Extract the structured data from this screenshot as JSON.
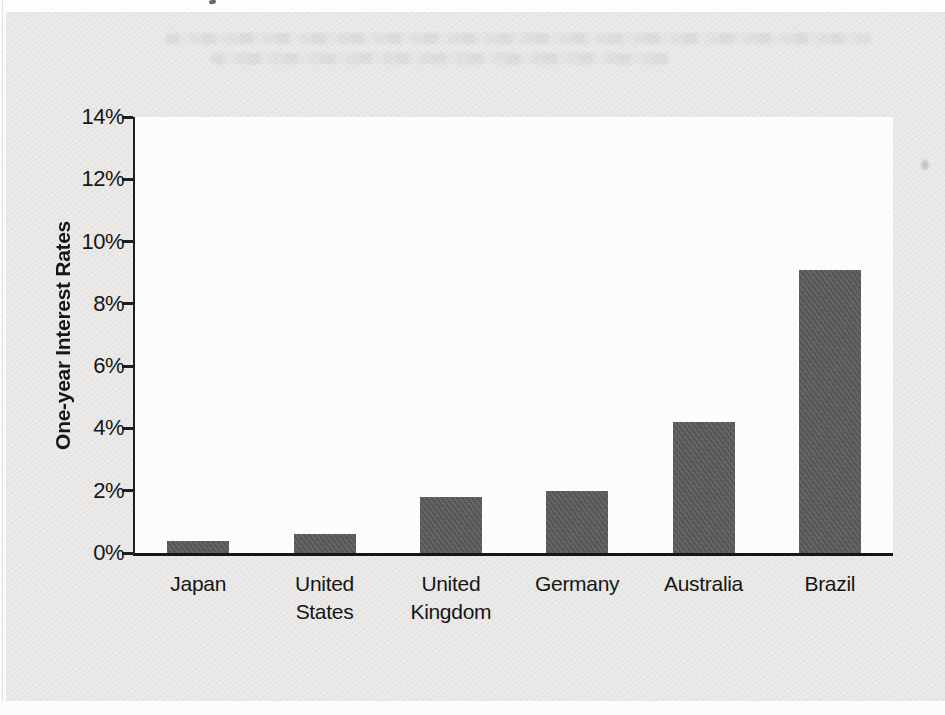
{
  "page": {
    "panel_background": "#e8e7e5",
    "plot_background": "#fcfcfa",
    "text_color": "#161616"
  },
  "chart_data": {
    "type": "bar",
    "title": "",
    "xlabel": "",
    "ylabel": "One-year Interest Rates",
    "categories": [
      "Japan",
      "United States",
      "United Kingdom",
      "Germany",
      "Australia",
      "Brazil"
    ],
    "category_display": [
      "Japan",
      "United\nStates",
      "United\nKingdom",
      "Germany",
      "Australia",
      "Brazil"
    ],
    "values": [
      0.4,
      0.6,
      1.8,
      2.0,
      4.2,
      9.1
    ],
    "ylim": [
      0,
      14
    ],
    "ytick_step": 2,
    "ytick_labels": [
      "0%",
      "2%",
      "4%",
      "6%",
      "8%",
      "10%",
      "12%",
      "14%"
    ],
    "grid": false,
    "legend": null,
    "bar_color": "#5c5b59",
    "axis_color": "#1f1f1f"
  }
}
